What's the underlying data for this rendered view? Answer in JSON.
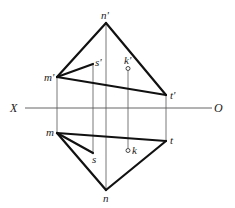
{
  "diagram": {
    "type": "orthographic-projection",
    "axis": {
      "left_label": "X",
      "right_label": "O",
      "y": 108,
      "x1": 25,
      "x2": 212
    },
    "points": {
      "n_prime": {
        "label": "n'",
        "x": 106,
        "y": 23
      },
      "m_prime": {
        "label": "m'",
        "x": 57,
        "y": 77
      },
      "t_prime": {
        "label": "t'",
        "x": 166,
        "y": 95
      },
      "s_prime": {
        "label": "s'",
        "x": 93,
        "y": 64
      },
      "k_prime": {
        "label": "k'",
        "x": 128,
        "y": 68
      },
      "m": {
        "label": "m",
        "x": 57,
        "y": 133
      },
      "t": {
        "label": "t",
        "x": 166,
        "y": 141
      },
      "s": {
        "label": "s",
        "x": 93,
        "y": 153
      },
      "k": {
        "label": "k",
        "x": 128,
        "y": 151
      },
      "n": {
        "label": "n",
        "x": 106,
        "y": 190
      }
    },
    "front_view_edges": [
      "m'-n'",
      "n'-t'",
      "m'-t'",
      "m'-s'"
    ],
    "top_view_edges": [
      "m-t",
      "m-n",
      "n-t",
      "m-s"
    ],
    "projectors": [
      "m'-m",
      "s'-s",
      "n'-n",
      "k'-k",
      "t'-t"
    ],
    "colors": {
      "edge": "#111111",
      "projector": "#555555",
      "background": "#ffffff"
    }
  }
}
